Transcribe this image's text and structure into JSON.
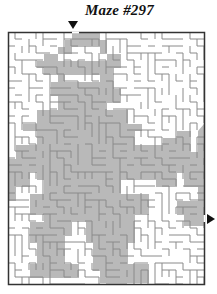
{
  "puzzle": {
    "title": "Maze #297"
  },
  "maze": {
    "colors": {
      "wall": "#8a8a8a",
      "border": "#333333",
      "solution": "#b9b9b9",
      "background": "#ffffff",
      "arrow": "#111111"
    },
    "bounds": {
      "x": 8,
      "y": 32,
      "width": 196,
      "height": 252
    },
    "entry_arrow": {
      "x": 72,
      "y": 25,
      "direction": "down"
    },
    "exit_arrow": {
      "x": 207,
      "y": 219,
      "direction": "right"
    },
    "cell": 7
  }
}
